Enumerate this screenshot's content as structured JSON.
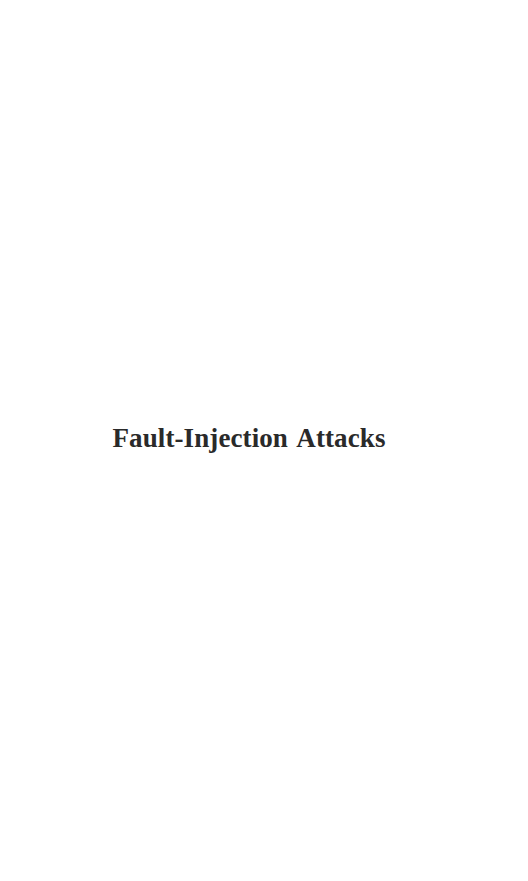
{
  "page": {
    "title": "Fault-Injection Attacks",
    "text_color": "#2a2a2a",
    "background_color": "#ffffff"
  }
}
